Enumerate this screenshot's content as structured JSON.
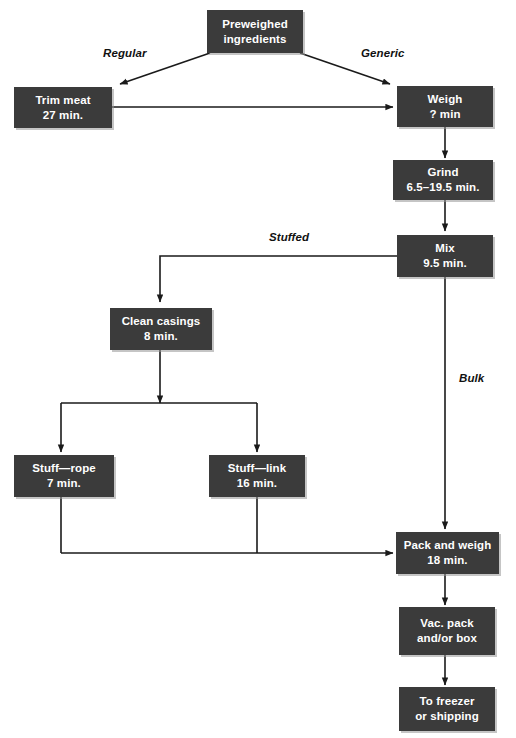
{
  "diagram": {
    "box_color": "#3b3b3b",
    "box_text_color": "#ffffff",
    "line_color": "#1a1a1a",
    "background": "#ffffff"
  },
  "nodes": {
    "preweighed": {
      "line1": "Preweighed",
      "line2": "ingredients"
    },
    "trim_meat": {
      "line1": "Trim meat",
      "line2": "27 min."
    },
    "weigh": {
      "line1": "Weigh",
      "line2": "? min"
    },
    "grind": {
      "line1": "Grind",
      "line2": "6.5–19.5 min."
    },
    "mix": {
      "line1": "Mix",
      "line2": "9.5 min."
    },
    "clean_casings": {
      "line1": "Clean casings",
      "line2": "8 min."
    },
    "stuff_rope": {
      "line1": "Stuff—rope",
      "line2": "7 min."
    },
    "stuff_link": {
      "line1": "Stuff—link",
      "line2": "16 min."
    },
    "pack_and_weigh": {
      "line1": "Pack and weigh",
      "line2": "18 min."
    },
    "vac_pack": {
      "line1": "Vac. pack",
      "line2": "and/or box"
    },
    "to_freezer": {
      "line1": "To freezer",
      "line2": "or shipping"
    }
  },
  "edge_labels": {
    "regular": "Regular",
    "generic": "Generic",
    "stuffed": "Stuffed",
    "bulk": "Bulk"
  }
}
